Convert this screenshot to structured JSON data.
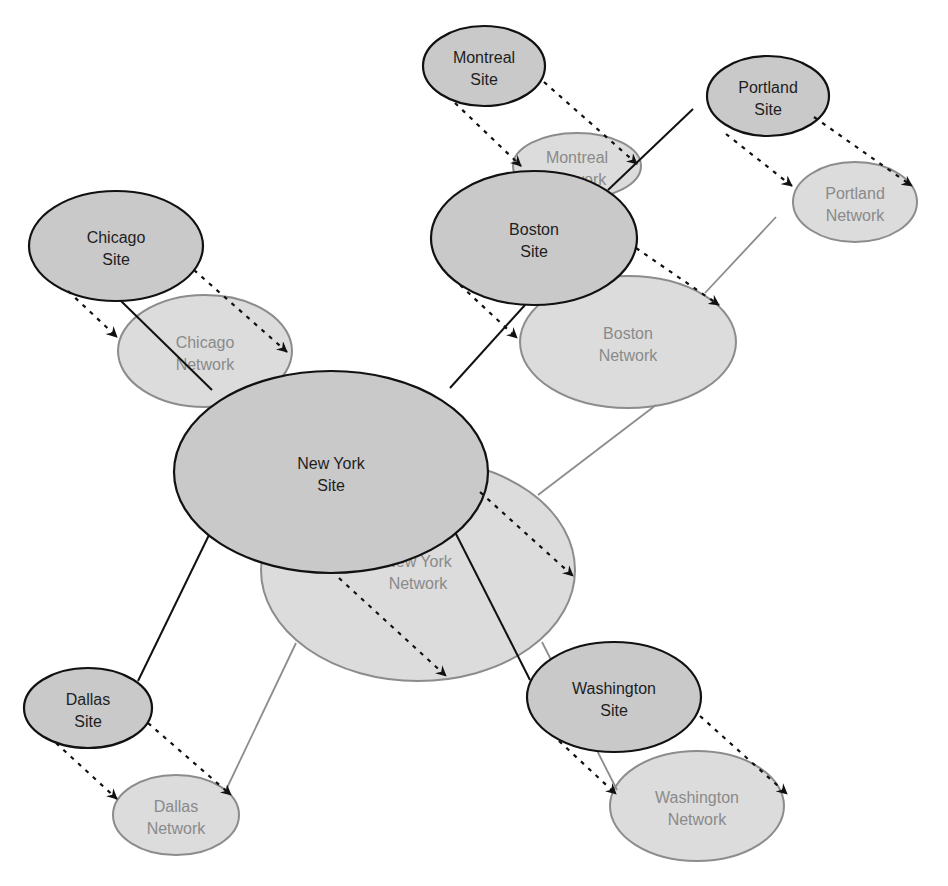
{
  "colors": {
    "background": "#ffffff",
    "site_fill": "#c9c9c9",
    "site_stroke": "#111111",
    "network_fill": "#dcdcdc",
    "network_stroke": "#8c8c8c",
    "site_text": "#1e1e1e",
    "network_text": "#8a8a8a",
    "site_link": "#111111",
    "network_link": "#8c8c8c",
    "arrow": "#111111"
  },
  "networks": [
    {
      "id": "montreal-network",
      "lines": [
        "Montreal",
        "Network"
      ],
      "cx": 577,
      "cy": 166,
      "rx": 64,
      "ry": 33
    },
    {
      "id": "chicago-network",
      "lines": [
        "Chicago",
        "Network"
      ],
      "cx": 205,
      "cy": 351,
      "rx": 87,
      "ry": 56
    },
    {
      "id": "new-york-network",
      "lines": [
        "New York",
        "Network"
      ],
      "cx": 418,
      "cy": 570,
      "rx": 157,
      "ry": 111
    },
    {
      "id": "boston-network",
      "lines": [
        "Boston",
        "Network"
      ],
      "cx": 628,
      "cy": 342,
      "rx": 108,
      "ry": 66
    },
    {
      "id": "portland-network",
      "lines": [
        "Portland",
        "Network"
      ],
      "cx": 855,
      "cy": 202,
      "rx": 62,
      "ry": 40
    },
    {
      "id": "dallas-network",
      "lines": [
        "Dallas",
        "Network"
      ],
      "cx": 176,
      "cy": 815,
      "rx": 63,
      "ry": 40
    },
    {
      "id": "washington-network",
      "lines": [
        "Washington",
        "Network"
      ],
      "cx": 697,
      "cy": 806,
      "rx": 87,
      "ry": 55
    }
  ],
  "sites": [
    {
      "id": "montreal-site",
      "lines": [
        "Montreal",
        "Site"
      ],
      "cx": 484,
      "cy": 66,
      "rx": 61,
      "ry": 40
    },
    {
      "id": "portland-site",
      "lines": [
        "Portland",
        "Site"
      ],
      "cx": 768,
      "cy": 96,
      "rx": 61,
      "ry": 40
    },
    {
      "id": "chicago-site",
      "lines": [
        "Chicago",
        "Site"
      ],
      "cx": 116,
      "cy": 246,
      "rx": 87,
      "ry": 55
    },
    {
      "id": "boston-site",
      "lines": [
        "Boston",
        "Site"
      ],
      "cx": 534,
      "cy": 238,
      "rx": 103,
      "ry": 67
    },
    {
      "id": "new-york-site",
      "lines": [
        "New York",
        "Site"
      ],
      "cx": 331,
      "cy": 472,
      "rx": 157,
      "ry": 101
    },
    {
      "id": "dallas-site",
      "lines": [
        "Dallas",
        "Site"
      ],
      "cx": 88,
      "cy": 708,
      "rx": 64,
      "ry": 40
    },
    {
      "id": "washington-site",
      "lines": [
        "Washington",
        "Site"
      ],
      "cx": 614,
      "cy": 697,
      "rx": 87,
      "ry": 55
    }
  ],
  "site_links": [
    {
      "from": "chicago-site",
      "to": "new-york-site",
      "x1": 120,
      "y1": 300,
      "x2": 212,
      "y2": 390
    },
    {
      "from": "new-york-site",
      "to": "boston-site",
      "x1": 450,
      "y1": 388,
      "x2": 525,
      "y2": 305
    },
    {
      "from": "boston-site",
      "to": "portland-site",
      "x1": 608,
      "y1": 190,
      "x2": 693,
      "y2": 109
    },
    {
      "from": "new-york-site",
      "to": "dallas-site",
      "x1": 209,
      "y1": 535,
      "x2": 138,
      "y2": 681
    },
    {
      "from": "new-york-site",
      "to": "washington-site",
      "x1": 455,
      "y1": 532,
      "x2": 530,
      "y2": 680
    }
  ],
  "network_links": [
    {
      "from": "boston-network",
      "to": "portland-network",
      "x1": 705,
      "y1": 293,
      "x2": 776,
      "y2": 217
    },
    {
      "from": "new-york-network",
      "to": "boston-network",
      "x1": 538,
      "y1": 495,
      "x2": 656,
      "y2": 405
    },
    {
      "from": "new-york-network",
      "to": "dallas-network",
      "x1": 296,
      "y1": 643,
      "x2": 226,
      "y2": 790
    },
    {
      "from": "new-york-network",
      "to": "washington-network",
      "x1": 542,
      "y1": 642,
      "x2": 617,
      "y2": 790
    }
  ],
  "dashed_arrows": [
    {
      "from": "montreal-site",
      "to": "montreal-network",
      "x1": 455,
      "y1": 103,
      "x2": 521,
      "y2": 166
    },
    {
      "from": "montreal-site",
      "to": "montreal-network",
      "x1": 544,
      "y1": 82,
      "x2": 637,
      "y2": 164
    },
    {
      "from": "portland-site",
      "to": "portland-network",
      "x1": 726,
      "y1": 134,
      "x2": 792,
      "y2": 186
    },
    {
      "from": "portland-site",
      "to": "portland-network",
      "x1": 814,
      "y1": 117,
      "x2": 912,
      "y2": 186
    },
    {
      "from": "chicago-site",
      "to": "chicago-network",
      "x1": 68,
      "y1": 291,
      "x2": 117,
      "y2": 337
    },
    {
      "from": "chicago-site",
      "to": "chicago-network",
      "x1": 194,
      "y1": 270,
      "x2": 287,
      "y2": 352
    },
    {
      "from": "boston-site",
      "to": "boston-network",
      "x1": 460,
      "y1": 285,
      "x2": 517,
      "y2": 338
    },
    {
      "from": "boston-site",
      "to": "boston-network",
      "x1": 636,
      "y1": 248,
      "x2": 719,
      "y2": 305
    },
    {
      "from": "new-york-site",
      "to": "new-york-network",
      "x1": 339,
      "y1": 578,
      "x2": 446,
      "y2": 676
    },
    {
      "from": "new-york-site",
      "to": "new-york-network",
      "x1": 480,
      "y1": 492,
      "x2": 573,
      "y2": 576
    },
    {
      "from": "dallas-site",
      "to": "dallas-network",
      "x1": 56,
      "y1": 743,
      "x2": 117,
      "y2": 799
    },
    {
      "from": "dallas-site",
      "to": "dallas-network",
      "x1": 148,
      "y1": 723,
      "x2": 231,
      "y2": 795
    },
    {
      "from": "washington-site",
      "to": "washington-network",
      "x1": 559,
      "y1": 741,
      "x2": 616,
      "y2": 794
    },
    {
      "from": "washington-site",
      "to": "washington-network",
      "x1": 700,
      "y1": 716,
      "x2": 787,
      "y2": 794
    }
  ]
}
